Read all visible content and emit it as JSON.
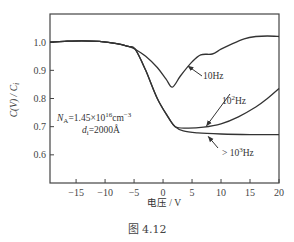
{
  "chart_data": {
    "type": "line",
    "title": "",
    "xlabel": "电压 / V",
    "ylabel": "C(V) / C_i",
    "xlim": [
      -19.5,
      20
    ],
    "ylim": [
      0.5,
      1.1
    ],
    "xticks": [
      -15,
      -10,
      -5,
      0,
      5,
      10,
      15,
      20
    ],
    "yticks": [
      0.6,
      0.7,
      0.8,
      0.9,
      1.0
    ],
    "xtick_labels": [
      "−15",
      "−10",
      "−5",
      "0",
      "5",
      "10",
      "15",
      "20"
    ],
    "ytick_labels": [
      "0.6",
      "0.7",
      "0.8",
      "0.9",
      "1.0"
    ],
    "grid": false,
    "legend": "none (inline arrow annotations)",
    "series": [
      {
        "name": "10Hz",
        "points": [
          [
            -19.5,
            1.0
          ],
          [
            -17,
            1.003
          ],
          [
            -14,
            1.005
          ],
          [
            -11,
            1.003
          ],
          [
            -8,
            0.995
          ],
          [
            -6,
            0.985
          ],
          [
            -4.8,
            0.975
          ],
          [
            -3,
            0.95
          ],
          [
            -1,
            0.91
          ],
          [
            0.5,
            0.87
          ],
          [
            1.6,
            0.84
          ],
          [
            3,
            0.88
          ],
          [
            5,
            0.93
          ],
          [
            6.5,
            0.955
          ],
          [
            8.5,
            0.958
          ],
          [
            10,
            0.975
          ],
          [
            12,
            0.995
          ],
          [
            14,
            1.012
          ],
          [
            16,
            1.02
          ],
          [
            18,
            1.022
          ],
          [
            20,
            1.02
          ]
        ]
      },
      {
        "name": "10^2Hz",
        "points": [
          [
            -19.5,
            1.0
          ],
          [
            -17,
            1.003
          ],
          [
            -14,
            1.005
          ],
          [
            -11,
            1.003
          ],
          [
            -8,
            0.995
          ],
          [
            -6,
            0.985
          ],
          [
            -4.8,
            0.975
          ],
          [
            -3,
            0.9
          ],
          [
            -1,
            0.8
          ],
          [
            1,
            0.73
          ],
          [
            2.1,
            0.7
          ],
          [
            4,
            0.695
          ],
          [
            7,
            0.698
          ],
          [
            10,
            0.71
          ],
          [
            13,
            0.735
          ],
          [
            16,
            0.77
          ],
          [
            18,
            0.8
          ],
          [
            20,
            0.835
          ]
        ]
      },
      {
        "name": ">10^3Hz",
        "points": [
          [
            -19.5,
            1.0
          ],
          [
            -17,
            1.003
          ],
          [
            -14,
            1.005
          ],
          [
            -11,
            1.003
          ],
          [
            -8,
            0.995
          ],
          [
            -6,
            0.985
          ],
          [
            -4.8,
            0.975
          ],
          [
            -3,
            0.9
          ],
          [
            -1,
            0.8
          ],
          [
            1,
            0.73
          ],
          [
            2.1,
            0.7
          ],
          [
            3.5,
            0.685
          ],
          [
            6,
            0.678
          ],
          [
            10,
            0.674
          ],
          [
            15,
            0.672
          ],
          [
            20,
            0.672
          ]
        ]
      }
    ],
    "annotations": [
      {
        "text": "10Hz",
        "x": 10.5,
        "y": 0.87,
        "arrow_to": [
          4.3,
          0.915
        ]
      },
      {
        "text": "10²Hz",
        "x": 11.5,
        "y": 0.79,
        "arrow_to": [
          7.5,
          0.703
        ]
      },
      {
        "text": ">10³Hz",
        "x": 10.5,
        "y": 0.615,
        "arrow_to": [
          7.8,
          0.665
        ]
      },
      {
        "text": "N_A=1.45×10^16 cm^-3",
        "x": -13,
        "y": 0.735
      },
      {
        "text": "d_i=2000Å",
        "x": -11,
        "y": 0.705
      }
    ]
  },
  "labels": {
    "ylabel_main": "C(V) / C",
    "ylabel_sub": "i",
    "xlabel": "电压 / V",
    "figure_caption": "图 4.12",
    "ann_10hz": "10Hz",
    "ann_100hz_base": "10",
    "ann_100hz_exp": "2",
    "ann_100hz_unit": "Hz",
    "ann_1khz_prefix": "> 10",
    "ann_1khz_exp": "3",
    "ann_1khz_unit": "Hz",
    "na_prefix": "N",
    "na_sub": "A",
    "na_mid": "=1.45×10",
    "na_exp": "16",
    "na_unit": "cm",
    "na_unit_exp": "−3",
    "di_prefix": "d",
    "di_sub": "i",
    "di_value": "=2000Å"
  },
  "colors": {
    "line": "#333333",
    "axis": "#444444",
    "background": "#ffffff"
  }
}
